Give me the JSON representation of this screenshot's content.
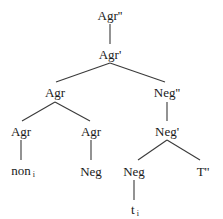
{
  "diagram": {
    "type": "syntax-tree",
    "nodes": {
      "agr_dp": {
        "label": "Agr''"
      },
      "agr_bar": {
        "label": "Agr'"
      },
      "agr_head": {
        "label": "Agr"
      },
      "neg_dp": {
        "label": "Neg''"
      },
      "agr_left": {
        "label": "Agr"
      },
      "agr_right": {
        "label": "Agr"
      },
      "neg_bar": {
        "label": "Neg'"
      },
      "non": {
        "label": "non",
        "subscript": "i"
      },
      "neg_under_agr": {
        "label": "Neg"
      },
      "neg_head": {
        "label": "Neg"
      },
      "t_dp": {
        "label": "T''"
      },
      "trace": {
        "label": "t",
        "subscript": "i"
      }
    },
    "edges": [
      [
        "agr_dp",
        "agr_bar"
      ],
      [
        "agr_bar",
        "agr_head"
      ],
      [
        "agr_bar",
        "neg_dp"
      ],
      [
        "agr_head",
        "agr_left"
      ],
      [
        "agr_head",
        "agr_right"
      ],
      [
        "neg_dp",
        "neg_bar"
      ],
      [
        "agr_left",
        "non"
      ],
      [
        "agr_right",
        "neg_under_agr"
      ],
      [
        "neg_bar",
        "neg_head"
      ],
      [
        "neg_bar",
        "t_dp"
      ],
      [
        "neg_head",
        "trace"
      ]
    ]
  }
}
